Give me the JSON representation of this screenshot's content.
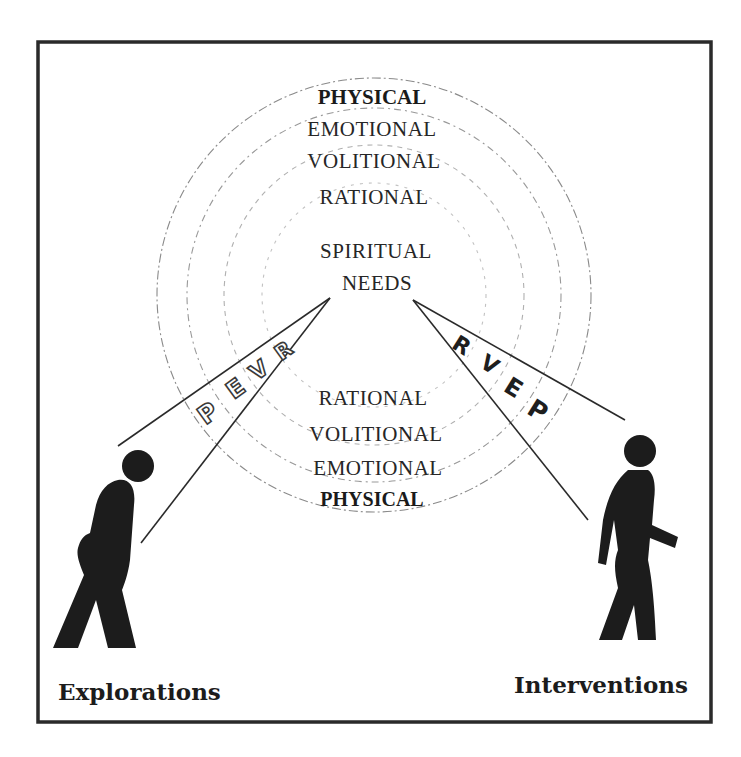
{
  "diagram": {
    "frame": {
      "border_color": "#2a2a2a"
    },
    "rings": {
      "center": [
        374,
        295
      ],
      "radii": [
        217,
        186,
        150,
        112
      ],
      "color": "#8a8a8a"
    },
    "top_labels": [
      {
        "text": "PHYSICAL",
        "weight": "bold"
      },
      {
        "text": "EMOTIONAL",
        "weight": "normal"
      },
      {
        "text": "VOLITIONAL",
        "weight": "normal"
      },
      {
        "text": "RATIONAL",
        "weight": "normal"
      }
    ],
    "core": {
      "line1": "SPIRITUAL",
      "line2": "NEEDS"
    },
    "bottom_labels": [
      {
        "text": "RATIONAL",
        "weight": "normal"
      },
      {
        "text": "VOLITIONAL",
        "weight": "normal"
      },
      {
        "text": "EMOTIONAL",
        "weight": "normal"
      },
      {
        "text": "PHYSICAL",
        "weight": "bold"
      }
    ],
    "left_wedge": {
      "letters": [
        "P",
        "E",
        "V",
        "R"
      ],
      "style": "outlined"
    },
    "right_wedge": {
      "letters": [
        "R",
        "V",
        "E",
        "P"
      ],
      "style": "solid"
    },
    "left_figure": {
      "name": "explorer",
      "caption": "Explorations"
    },
    "right_figure": {
      "name": "intervener",
      "caption": "Interventions"
    }
  }
}
